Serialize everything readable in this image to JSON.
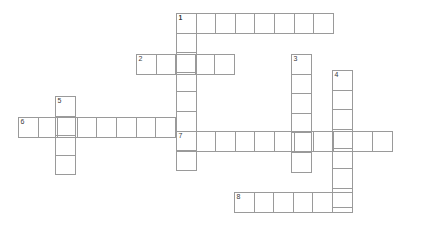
{
  "puzzle": {
    "title": "Crossword Grid",
    "cell_size": 20.6,
    "grid_line_color": "#9a9a9a",
    "background_color": "#ffffff",
    "number_color": "#3a3a3a",
    "entries": [
      {
        "number": "1",
        "direction": "across",
        "x": 176,
        "y": 13,
        "length": 8,
        "letters": [
          "",
          "",
          "",
          "",
          "",
          "",
          "",
          ""
        ]
      },
      {
        "number": "1",
        "direction": "down",
        "x": 176,
        "y": 13,
        "length": 8,
        "letters": [
          "",
          "",
          "",
          "",
          "",
          "",
          "",
          ""
        ]
      },
      {
        "number": "2",
        "direction": "across",
        "x": 136,
        "y": 54,
        "length": 5,
        "letters": [
          "",
          "",
          "",
          "",
          ""
        ]
      },
      {
        "number": "3",
        "direction": "down",
        "x": 291,
        "y": 54,
        "length": 6,
        "letters": [
          "",
          "",
          "",
          "",
          "",
          ""
        ]
      },
      {
        "number": "4",
        "direction": "down",
        "x": 332,
        "y": 70,
        "length": 7,
        "letters": [
          "",
          "",
          "",
          "",
          "",
          "",
          ""
        ]
      },
      {
        "number": "5",
        "direction": "down",
        "x": 55,
        "y": 96,
        "length": 4,
        "letters": [
          "",
          "",
          "",
          ""
        ]
      },
      {
        "number": "6",
        "direction": "across",
        "x": 18,
        "y": 117,
        "length": 8,
        "letters": [
          "",
          "",
          "",
          "",
          "",
          "",
          "",
          ""
        ]
      },
      {
        "number": "7",
        "direction": "across",
        "x": 176,
        "y": 131,
        "length": 11,
        "letters": [
          "",
          "",
          "",
          "",
          "",
          "",
          "",
          "",
          "",
          "",
          ""
        ]
      },
      {
        "number": "8",
        "direction": "across",
        "x": 234,
        "y": 192,
        "length": 6,
        "letters": [
          "",
          "",
          "",
          "",
          "",
          ""
        ]
      }
    ]
  }
}
